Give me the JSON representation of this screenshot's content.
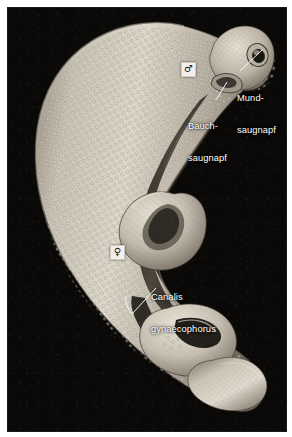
{
  "figure": {
    "caption_present": false,
    "background_color": "#ffffff",
    "plate_color": "#090808",
    "label_color": "#ffffff",
    "leader_color": "#ffffff",
    "specimen_color_light": "#d9d4c9",
    "specimen_color_mid": "#a39b8d",
    "specimen_color_dark": "#5c5549"
  },
  "annotations": {
    "labels": [
      {
        "id": "mundsaugnapf",
        "line1": "Mund-",
        "line2": "saugnapf",
        "x": 228,
        "y": 66
      },
      {
        "id": "bauchsaugnapf",
        "line1": "Bauch-",
        "line2": "saugnapf",
        "x": 187,
        "y": 94
      },
      {
        "id": "canalis-gynaecophorus",
        "line1": "Canalis",
        "line2": "gynaecophorus",
        "x": 150,
        "y": 269
      }
    ],
    "sex_markers": [
      {
        "id": "male",
        "symbol": "♂",
        "x": 181,
        "y": 62
      },
      {
        "id": "female",
        "symbol": "♀",
        "x": 110,
        "y": 245
      }
    ]
  }
}
